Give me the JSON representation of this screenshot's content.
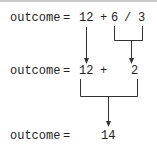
{
  "diagram": {
    "rows": [
      {
        "label": "outcome",
        "equals": "=",
        "tokens": [
          "12",
          "+",
          "6",
          "/",
          "3"
        ]
      },
      {
        "label": "outcome",
        "equals": "=",
        "tokens": [
          "12",
          "+",
          "2"
        ]
      },
      {
        "label": "outcome",
        "equals": "=",
        "tokens": [
          "14"
        ]
      }
    ],
    "line_color": "#333333"
  }
}
